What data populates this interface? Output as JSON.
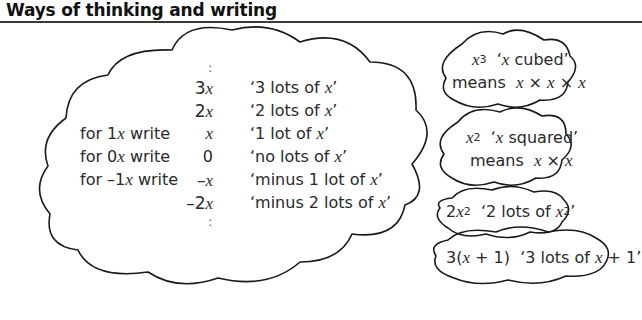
{
  "header": {
    "title": "Ways of thinking and writing"
  },
  "main_cloud": {
    "top_ellipsis": ":",
    "bottom_ellipsis": ":",
    "rows": [
      {
        "label": "",
        "expression": "3x",
        "meaning": "'3 lots of x'"
      },
      {
        "label": "",
        "expression": "2x",
        "meaning": "'2 lots of x'"
      },
      {
        "label": "for 1x write",
        "expression": "x",
        "meaning": "'1 lot of x'"
      },
      {
        "label": "for 0x write",
        "expression": "0",
        "meaning": "'no lots of x'"
      },
      {
        "label": "for -1x write",
        "expression": "-x",
        "meaning": "'minus 1 lot of x'"
      },
      {
        "label": "",
        "expression": "-2x",
        "meaning": "'minus 2 lots of x'"
      }
    ]
  },
  "side_clouds": [
    {
      "line1": "x^3 'x cubed'",
      "line2": "means x × x × x"
    },
    {
      "line1": "x^2 'x squared'",
      "line2": "means x × x"
    },
    {
      "line1": "2x^2 '2 lots of x^2'"
    },
    {
      "line1": "3(x + 1) '3 lots of x + 1'"
    }
  ],
  "colors": {
    "text": "#2a2a2a",
    "outline": "#1a1a1a",
    "background": "#ffffff"
  }
}
